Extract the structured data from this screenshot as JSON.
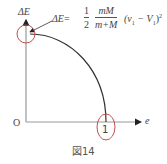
{
  "figure": {
    "caption": "図14",
    "axes": {
      "y_label": "ΔE",
      "x_label": "e",
      "origin_label": "O",
      "x_tick_label": "1"
    },
    "formula": {
      "lhs": "ΔE",
      "equals": "=",
      "frac1_num": "1",
      "frac1_den": "2",
      "frac2_num": "mM",
      "frac2_den": "m+M",
      "tail": "(v",
      "sub1": "1",
      "minus": " − V",
      "sub2": "1",
      "close": ")",
      "sup": "2"
    },
    "colors": {
      "axis": "#999999",
      "curve": "#333333",
      "highlight": "#c0504d",
      "text": "#444444"
    }
  }
}
